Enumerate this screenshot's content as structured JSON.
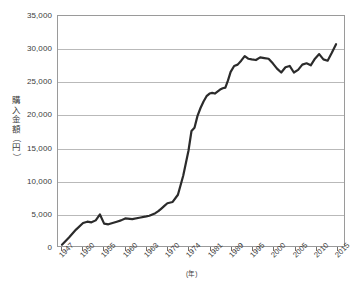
{
  "chart_data": {
    "type": "line",
    "title": "",
    "subtitle": "",
    "xlabel": "(年)",
    "ylabel": "購入金額（円）",
    "ylabel_chars": [
      "購",
      "入",
      "金",
      "額",
      "（",
      "円",
      "）"
    ],
    "ylim": [
      0,
      35000
    ],
    "yticks": [
      0,
      5000,
      10000,
      15000,
      20000,
      25000,
      30000,
      35000
    ],
    "ytick_labels": [
      "0",
      "5,000",
      "10,000",
      "15,000",
      "20,000",
      "25,000",
      "30,000",
      "35,000"
    ],
    "grid": true,
    "grid_axis": "y",
    "legend": false,
    "legend_position": "none",
    "xlim": [
      1947,
      2015
    ],
    "xtick_labels": [
      "1947",
      "1950",
      "1955",
      "1960",
      "1963",
      "1970",
      "1974",
      "1981",
      "1989",
      "1995",
      "2000",
      "2005",
      "2010",
      "2015"
    ],
    "xtick_values": [
      1947,
      1950,
      1955,
      1960,
      1963,
      1970,
      1974,
      1981,
      1989,
      1995,
      2000,
      2005,
      2010,
      2015
    ],
    "line_color": "#2b2b2b",
    "line_width": 2.2,
    "series": [
      {
        "name": "購入金額",
        "x": [
          1947,
          1948,
          1949,
          1950,
          1951,
          1952,
          1953,
          1954,
          1955,
          1956,
          1957,
          1958,
          1959,
          1960,
          1961,
          1962,
          1963,
          1964,
          1965,
          1966,
          1967,
          1968,
          1969,
          1970,
          1971,
          1972,
          1973,
          1974,
          1975,
          1976,
          1977,
          1978,
          1979,
          1980,
          1981,
          1982,
          1983,
          1984,
          1985,
          1986,
          1987,
          1988,
          1989,
          1990,
          1991,
          1992,
          1993,
          1994,
          1995,
          1996,
          1997,
          1998,
          1999,
          2000,
          2001,
          2002,
          2003,
          2004,
          2005,
          2006,
          2007,
          2008,
          2009,
          2010,
          2011,
          2012,
          2013,
          2014,
          2015
        ],
        "values": [
          200,
          1300,
          2500,
          3500,
          3700,
          3600,
          3900,
          4800,
          3400,
          3300,
          3500,
          3700,
          3900,
          4200,
          4100,
          4300,
          4500,
          4600,
          4800,
          5000,
          5300,
          5700,
          6100,
          6500,
          6700,
          7800,
          10700,
          14500,
          17500,
          18000,
          19800,
          21000,
          22000,
          22800,
          23200,
          23300,
          23200,
          23500,
          23800,
          24000,
          24100,
          25200,
          26500,
          27400,
          27600,
          28200,
          28900,
          28500,
          28400,
          28300,
          28700,
          28600,
          28500,
          27800,
          27000,
          26400,
          27200,
          27400,
          26400,
          26800,
          27600,
          27800,
          27500,
          28500,
          29200,
          28400,
          28200,
          29400,
          30700
        ]
      }
    ]
  }
}
